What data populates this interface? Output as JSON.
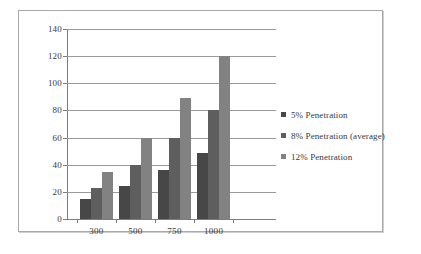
{
  "chart_data": {
    "type": "bar",
    "title": "",
    "subtitle": "",
    "xlabel": "",
    "ylabel": "",
    "categories": [
      "300",
      "500",
      "750",
      "1000"
    ],
    "series": [
      {
        "name": "5% Penetration",
        "color": "#474747",
        "values": [
          15,
          24,
          36,
          49
        ]
      },
      {
        "name": "8% Penetration (average)",
        "color": "#5e5e5e",
        "values": [
          23,
          40,
          60,
          80
        ]
      },
      {
        "name": "12% Penetration",
        "color": "#828282",
        "values": [
          35,
          60,
          89,
          120
        ]
      }
    ],
    "ylim": [
      0,
      140
    ],
    "yticks": [
      0,
      20,
      40,
      60,
      80,
      100,
      120,
      140
    ],
    "ytick_labels": [
      "0",
      "20",
      "40",
      "60",
      "80",
      "100",
      "120",
      "140"
    ],
    "grid": true,
    "grid_axis": "y",
    "legend_position": "right",
    "frame": true
  }
}
